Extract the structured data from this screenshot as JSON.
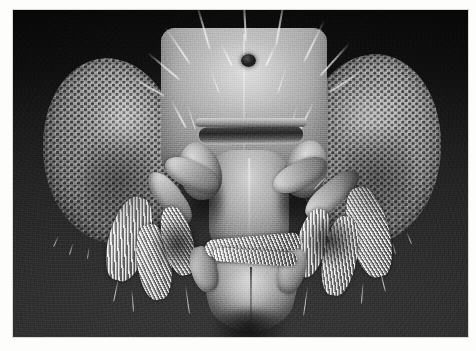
{
  "page": {
    "background_color": "#fdfdfb",
    "caption": ""
  },
  "photo": {
    "kind": "scanning-electron-micrograph",
    "subject": "fruit fly head, frontal view",
    "color_mode": "grayscale",
    "border_color": "#d8d8d4",
    "background_top_color": "#050505",
    "background_bottom_color": "#333333",
    "bounds": {
      "left": 13,
      "top": 10,
      "width": 455,
      "height": 327
    }
  },
  "specimen": {
    "parts": [
      {
        "name": "left-compound-eye",
        "label": "Left compound eye",
        "texture": "hexagonal ommatidia lattice"
      },
      {
        "name": "right-compound-eye",
        "label": "Right compound eye",
        "texture": "hexagonal ommatidia lattice"
      },
      {
        "name": "frons",
        "label": "Frons / head capsule"
      },
      {
        "name": "ocellus",
        "label": "Ocellus",
        "color": "#0a0a0a"
      },
      {
        "name": "clypeus",
        "label": "Clypeus / face"
      },
      {
        "name": "ptilinal-suture",
        "label": "Ptilinal suture"
      },
      {
        "name": "left-maxillary-palp",
        "label": "Left maxillary palp"
      },
      {
        "name": "right-maxillary-palp",
        "label": "Right maxillary palp"
      },
      {
        "name": "rostrum",
        "label": "Rostrum"
      },
      {
        "name": "labellum",
        "label": "Labellum"
      },
      {
        "name": "left-foreleg",
        "label": "Left foreleg"
      },
      {
        "name": "right-foreleg",
        "label": "Right foreleg"
      },
      {
        "name": "head-bristles",
        "label": "Head bristles (macrochaetae)"
      }
    ]
  }
}
